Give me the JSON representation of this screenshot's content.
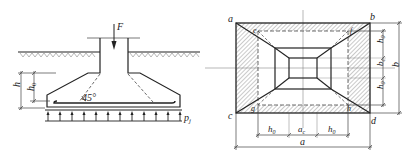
{
  "left_figure": {
    "title": "Footing section",
    "load_label": "F",
    "angle_label": "45°",
    "height_label": "h",
    "effective_height_label": "h",
    "effective_height_sub": "0",
    "pressure_label": "p",
    "pressure_sub": "j"
  },
  "right_figure": {
    "title": "Footing plan",
    "corners": {
      "a": "a",
      "b": "b",
      "c": "c",
      "d": "d"
    },
    "inner_points": {
      "e": "e",
      "f": "f",
      "g": "g",
      "h": "h"
    },
    "right_dims": {
      "h0_top": "h",
      "h0_top_sub": "0",
      "bc": "b",
      "bc_sub": "c",
      "h0_bottom": "h",
      "h0_bottom_sub": "0",
      "b_total": "b"
    },
    "bottom_dims": {
      "h0_left": "h",
      "h0_left_sub": "0",
      "ac": "a",
      "ac_sub": "c",
      "h0_right": "h",
      "h0_right_sub": "0",
      "a_total": "a"
    }
  },
  "colors": {
    "line": "#222222",
    "hatch": "#555555",
    "thin": "#666666",
    "background": "#ffffff"
  }
}
